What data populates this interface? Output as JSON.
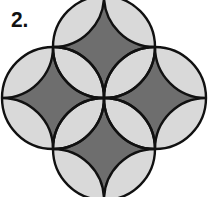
{
  "figure": {
    "label": "2.",
    "radius": 51,
    "flower_centers": [
      {
        "name": "top",
        "cx": 104,
        "cy": 47
      },
      {
        "name": "left",
        "cx": 53,
        "cy": 98
      },
      {
        "name": "right",
        "cx": 155,
        "cy": 98
      },
      {
        "name": "bottom",
        "cx": 104,
        "cy": 149
      }
    ],
    "colors": {
      "light_fill": "#d9d9d9",
      "dark_fill": "#6e6e6e",
      "stroke": "#111111",
      "background": "#ffffff"
    }
  }
}
